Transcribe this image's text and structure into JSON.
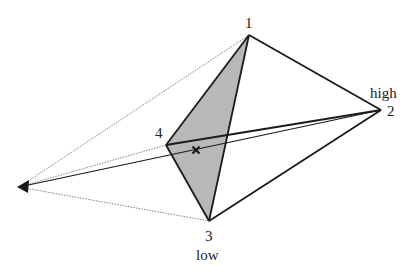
{
  "diagram": {
    "type": "simplex-projection",
    "colors": {
      "stroke": "#1a1a1a",
      "thin_stroke": "#555555",
      "face_fill": "#b8b8b8",
      "background": "#ffffff"
    },
    "vertices": [
      {
        "id": "1",
        "label": "1",
        "x": 249,
        "y": 35,
        "extra_label": ""
      },
      {
        "id": "2",
        "label": "2",
        "x": 381,
        "y": 110,
        "extra_label": "high"
      },
      {
        "id": "3",
        "label": "3",
        "x": 209,
        "y": 221,
        "extra_label": "low"
      },
      {
        "id": "4",
        "label": "4",
        "x": 166,
        "y": 145,
        "extra_label": ""
      }
    ],
    "apex": {
      "x": 19,
      "y": 187,
      "marker": "arrowhead"
    },
    "centroid_marker": {
      "x": 196,
      "y": 150,
      "glyph": "×"
    },
    "shaded_face": [
      "1",
      "4",
      "3"
    ],
    "thick_edges": [
      [
        "1",
        "2"
      ],
      [
        "2",
        "3"
      ],
      [
        "1",
        "4"
      ],
      [
        "4",
        "3"
      ],
      [
        "1",
        "3"
      ],
      [
        "4",
        "2"
      ]
    ],
    "projection_lines_dotted": [
      [
        "apex",
        "1"
      ],
      [
        "apex",
        "4"
      ],
      [
        "apex",
        "3"
      ]
    ],
    "projection_line_solid": [
      "apex",
      "2"
    ]
  }
}
